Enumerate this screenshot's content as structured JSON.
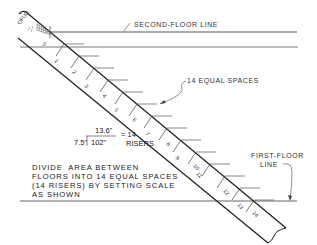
{
  "labels": {
    "second_floor": "SECOND-FLOOR LINE",
    "equal_spaces": "14 EQUAL SPACES",
    "first_floor_line1": "FIRST-FLOOR",
    "first_floor_line2": "LINE"
  },
  "calculation": {
    "divisor": "7.5\"",
    "dividend": "102\"",
    "quotient": "13.6\"",
    "equals": "= 14",
    "result": "RISERS"
  },
  "instruction": {
    "line1": "DIVIDE  AREA BETWEEN",
    "line2": "FLOORS INTO 14 EQUAL SPACES",
    "line3": "(14 RISERS) BY SETTING SCALE",
    "line4": "AS SHOWN"
  },
  "scale": {
    "end_label": "OFUQ",
    "tick_labels": [
      "0",
      "2",
      "4",
      "6",
      "8",
      "10",
      "12",
      "14"
    ],
    "alt_tick_labels": [
      "1",
      "3",
      "5",
      "7",
      "9",
      "11",
      "13"
    ],
    "divisions": 14
  },
  "colors": {
    "line": "#222222",
    "thin_line": "#555555",
    "background": "#ffffff"
  }
}
